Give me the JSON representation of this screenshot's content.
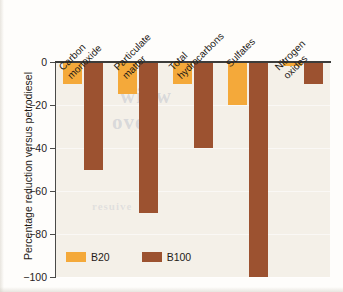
{
  "chart_data": {
    "type": "bar",
    "title": "",
    "subtitle": "",
    "xlabel": "",
    "ylabel": "Percentage reduction versus petrodiesel",
    "categories": [
      "Carbon monoxide",
      "Particulate matter",
      "Total hydrocarbons",
      "Sulfates",
      "Nitrogen oxides"
    ],
    "category_lines": [
      [
        "Carbon",
        "monoxide"
      ],
      [
        "Particulate",
        "matter"
      ],
      [
        "Total",
        "hydrocarbons"
      ],
      [
        "Sulfates",
        ""
      ],
      [
        "Nitrogen",
        "oxides"
      ]
    ],
    "series": [
      {
        "name": "B20",
        "color": "#f4a93a",
        "values": [
          -10,
          -15,
          -10,
          -20,
          -2
        ]
      },
      {
        "name": "B100",
        "color": "#9c5230",
        "values": [
          -50,
          -70,
          -40,
          -100,
          -10
        ]
      }
    ],
    "ylim": [
      -100,
      0
    ],
    "yticks": [
      0,
      -20,
      -40,
      -60,
      -80,
      -100
    ],
    "ytick_labels": [
      "0",
      "−20",
      "−40",
      "−60",
      "−80",
      "−100"
    ],
    "grid": true,
    "grid_axis": "y",
    "legend_position": "bottom-left",
    "legend": [
      "B20",
      "B100"
    ]
  },
  "legend": {
    "entries": [
      {
        "label": "B20",
        "color": "#f4a93a"
      },
      {
        "label": "B100",
        "color": "#9c5230"
      }
    ]
  },
  "axes": {
    "y_title": "Percentage reduction versus petrodiesel",
    "y_tick_labels": [
      "0",
      "−20",
      "−40",
      "−60",
      "−80",
      "−100"
    ]
  },
  "background": {
    "ghost_text_1": "winw",
    "ghost_text_2": "oveo",
    "ghost_text_3": "resuive"
  },
  "colors": {
    "b20": "#f4a93a",
    "b100": "#9c5230",
    "plot_background": "#f4f0e8",
    "axis": "#4a4a48",
    "text": "#1f1b17"
  }
}
